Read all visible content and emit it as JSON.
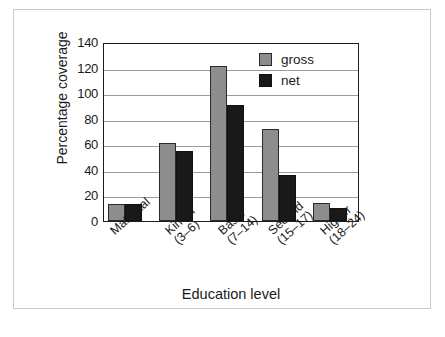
{
  "chart_data": {
    "type": "bar",
    "title": "",
    "subtitle": "",
    "xlabel": "Education level",
    "ylabel": "Percentage coverage",
    "categories": [
      "Maternal",
      "Kinder (3–6)",
      "Basic (7–14)",
      "Second (15–17)",
      "Higher (18–24)"
    ],
    "category_lines": [
      {
        "line1": "Maternal",
        "line2": ""
      },
      {
        "line1": "Kinder",
        "line2": "(3–6)"
      },
      {
        "line1": "Basic",
        "line2": "(7–14)"
      },
      {
        "line1": "Second",
        "line2": "(15–17)"
      },
      {
        "line1": "Higher",
        "line2": "(18–24)"
      }
    ],
    "series": [
      {
        "name": "gross",
        "color": "#8d8d8d",
        "values": [
          13,
          61,
          121,
          72,
          14
        ]
      },
      {
        "name": "net",
        "color": "#191919",
        "values": [
          13,
          55,
          91,
          36,
          10
        ]
      }
    ],
    "ylim": [
      0,
      140
    ],
    "yticks": [
      0,
      20,
      40,
      60,
      80,
      100,
      120,
      140
    ],
    "ytick_labels": [
      "0",
      "20",
      "40",
      "60",
      "80",
      "100",
      "120",
      "140"
    ],
    "grid": "horizontal",
    "legend_position": "top-right",
    "legend_entries": [
      "gross",
      "net"
    ]
  },
  "colors": {
    "gross": "#8d8d8d",
    "net": "#191919",
    "axis": "#1d1d1d",
    "grid": "#9b9b9b",
    "frame": "#c9c9c9",
    "background": "#ffffff"
  }
}
